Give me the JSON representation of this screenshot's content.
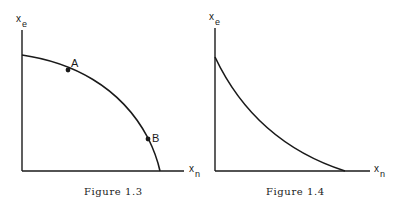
{
  "figures": [
    {
      "id": "fig13",
      "caption": "Figure 1.3",
      "y_axis_label": "x",
      "y_axis_sub": "e",
      "x_axis_label": "x",
      "x_axis_sub": "n",
      "curve": "concave (bowed-out) from y-axis to x-axis",
      "points": [
        {
          "label": "A"
        },
        {
          "label": "B"
        }
      ]
    },
    {
      "id": "fig14",
      "caption": "Figure 1.4",
      "y_axis_label": "x",
      "y_axis_sub": "e",
      "x_axis_label": "x",
      "x_axis_sub": "n",
      "curve": "convex (bowed-in) from y-axis to x-axis"
    }
  ],
  "colors": {
    "ink": "#1a1a1a",
    "background": "#ffffff"
  }
}
